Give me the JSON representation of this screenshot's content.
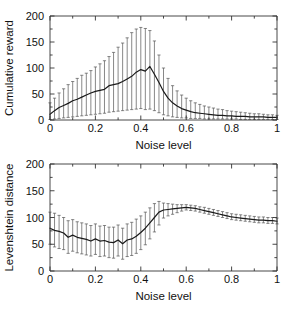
{
  "figure": {
    "background": "#ffffff",
    "line_color": "#1a1a1a",
    "errorbar_color": "#555555"
  },
  "panels": [
    {
      "id": "cumulative-reward-panel",
      "xlabel": "Noise level",
      "ylabel": "Cumulative reward",
      "xticks": [
        "0",
        "0.2",
        "0.4",
        "0.6",
        "0.8",
        "1"
      ],
      "yticks": [
        "0",
        "50",
        "100",
        "150",
        "200"
      ]
    },
    {
      "id": "levenshtein-distance-panel",
      "xlabel": "Noise level",
      "ylabel": "Levenshtein distance",
      "xticks": [
        "0",
        "0.2",
        "0.4",
        "0.6",
        "0.8",
        "1"
      ],
      "yticks": [
        "0",
        "50",
        "100",
        "150",
        "200"
      ]
    }
  ],
  "chart_data": [
    {
      "type": "line",
      "id": "cumulative-reward",
      "title": "",
      "xlabel": "Noise level",
      "ylabel": "Cumulative reward",
      "xlim": [
        0,
        1
      ],
      "ylim": [
        0,
        200
      ],
      "xticks": [
        0,
        0.2,
        0.4,
        0.6,
        0.8,
        1
      ],
      "yticks": [
        0,
        50,
        100,
        150,
        200
      ],
      "grid": false,
      "legend": "none",
      "errorbars": "vertical-with-caps",
      "x": [
        0.0,
        0.02,
        0.04,
        0.06,
        0.08,
        0.1,
        0.12,
        0.14,
        0.16,
        0.18,
        0.2,
        0.22,
        0.24,
        0.26,
        0.28,
        0.3,
        0.32,
        0.34,
        0.36,
        0.38,
        0.4,
        0.42,
        0.44,
        0.46,
        0.48,
        0.5,
        0.52,
        0.54,
        0.56,
        0.58,
        0.6,
        0.62,
        0.64,
        0.66,
        0.68,
        0.7,
        0.72,
        0.74,
        0.76,
        0.78,
        0.8,
        0.82,
        0.84,
        0.86,
        0.88,
        0.9,
        0.92,
        0.94,
        0.96,
        0.98,
        1.0
      ],
      "mean": [
        11,
        18,
        24,
        28,
        32,
        37,
        40,
        44,
        48,
        52,
        55,
        57,
        59,
        66,
        68,
        70,
        74,
        79,
        84,
        92,
        97,
        94,
        103,
        88,
        72,
        55,
        42,
        33,
        27,
        22,
        19,
        16,
        14,
        13,
        12,
        11,
        10,
        9,
        9,
        8,
        8,
        7,
        7,
        7,
        6,
        6,
        6,
        6,
        5,
        5,
        5
      ],
      "err_upper": [
        33,
        42,
        52,
        60,
        68,
        74,
        80,
        86,
        90,
        95,
        102,
        108,
        114,
        122,
        130,
        140,
        148,
        158,
        168,
        175,
        178,
        176,
        172,
        152,
        125,
        100,
        80,
        66,
        56,
        48,
        42,
        37,
        33,
        30,
        27,
        25,
        23,
        21,
        20,
        18,
        17,
        16,
        15,
        14,
        13,
        12,
        12,
        11,
        10,
        10,
        9
      ],
      "err_lower": [
        1,
        2,
        3,
        4,
        5,
        6,
        7,
        8,
        9,
        10,
        11,
        12,
        13,
        15,
        16,
        17,
        18,
        19,
        20,
        21,
        22,
        20,
        21,
        18,
        14,
        10,
        8,
        6,
        5,
        4,
        4,
        3,
        3,
        3,
        2,
        2,
        2,
        2,
        2,
        2,
        2,
        2,
        1,
        1,
        1,
        1,
        1,
        1,
        1,
        1,
        1
      ],
      "peak": {
        "x": 0.41,
        "mean": 103,
        "upper": 178
      }
    },
    {
      "type": "line",
      "id": "levenshtein-distance",
      "title": "",
      "xlabel": "Noise level",
      "ylabel": "Levenshtein distance",
      "xlim": [
        0,
        1
      ],
      "ylim": [
        0,
        200
      ],
      "xticks": [
        0,
        0.2,
        0.4,
        0.6,
        0.8,
        1
      ],
      "yticks": [
        0,
        50,
        100,
        150,
        200
      ],
      "grid": false,
      "legend": "none",
      "errorbars": "vertical-with-caps",
      "x": [
        0.0,
        0.02,
        0.04,
        0.06,
        0.08,
        0.1,
        0.12,
        0.14,
        0.16,
        0.18,
        0.2,
        0.22,
        0.24,
        0.26,
        0.28,
        0.3,
        0.32,
        0.34,
        0.36,
        0.38,
        0.4,
        0.42,
        0.44,
        0.46,
        0.48,
        0.5,
        0.52,
        0.54,
        0.56,
        0.58,
        0.6,
        0.62,
        0.64,
        0.66,
        0.68,
        0.7,
        0.72,
        0.74,
        0.76,
        0.78,
        0.8,
        0.82,
        0.84,
        0.86,
        0.88,
        0.9,
        0.92,
        0.94,
        0.96,
        0.98,
        1.0
      ],
      "mean": [
        80,
        76,
        74,
        71,
        63,
        67,
        63,
        61,
        59,
        56,
        60,
        56,
        57,
        54,
        53,
        58,
        51,
        58,
        60,
        65,
        72,
        80,
        90,
        100,
        110,
        114,
        115,
        116,
        117,
        118,
        119,
        118,
        117,
        115,
        113,
        111,
        109,
        107,
        105,
        103,
        101,
        100,
        99,
        98,
        97,
        96,
        95,
        95,
        94,
        94,
        93
      ],
      "err_upper": [
        110,
        108,
        104,
        100,
        94,
        96,
        92,
        90,
        88,
        85,
        88,
        84,
        85,
        82,
        82,
        86,
        80,
        88,
        91,
        97,
        103,
        110,
        118,
        126,
        130,
        127,
        126,
        125,
        124,
        124,
        124,
        123,
        122,
        120,
        119,
        117,
        115,
        113,
        111,
        109,
        107,
        106,
        105,
        104,
        103,
        102,
        101,
        101,
        100,
        100,
        99
      ],
      "err_lower": [
        50,
        45,
        42,
        40,
        33,
        37,
        34,
        32,
        30,
        28,
        31,
        27,
        28,
        25,
        24,
        28,
        22,
        27,
        29,
        33,
        40,
        49,
        60,
        73,
        86,
        99,
        103,
        106,
        109,
        112,
        114,
        113,
        112,
        110,
        108,
        106,
        104,
        102,
        100,
        98,
        96,
        95,
        94,
        93,
        92,
        91,
        90,
        90,
        89,
        89,
        88
      ]
    }
  ]
}
